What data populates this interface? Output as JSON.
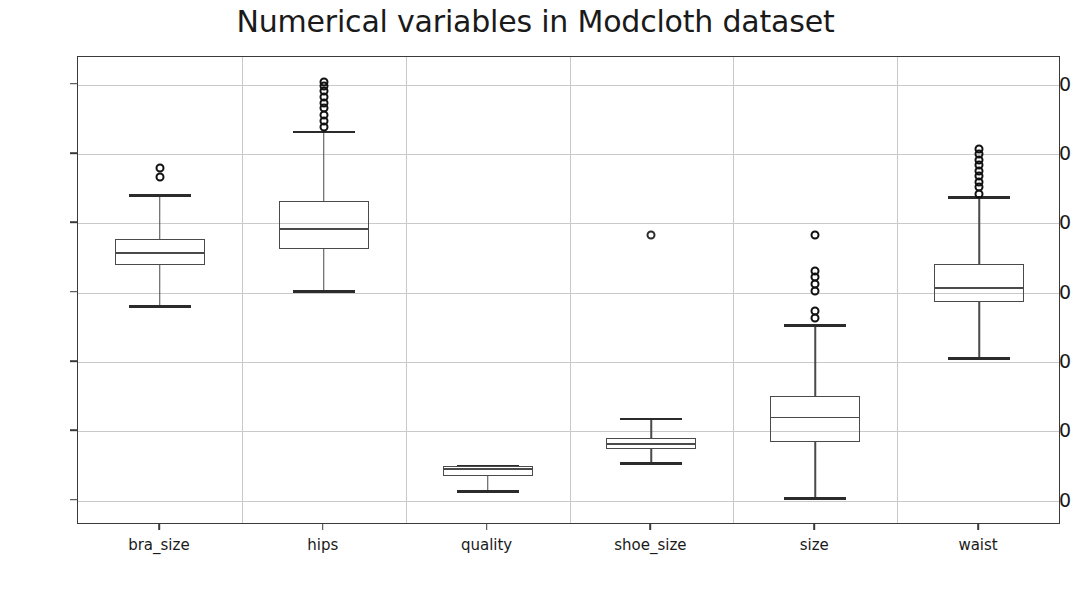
{
  "chart_data": {
    "type": "box",
    "title": "Numerical variables in Modcloth dataset",
    "xlabel": "",
    "ylabel": "",
    "ylim": [
      -3.5,
      64.0
    ],
    "yticks": [
      0,
      10,
      20,
      30,
      40,
      50,
      60
    ],
    "grid": true,
    "legend": null,
    "categories": [
      "bra_size",
      "hips",
      "quality",
      "shoe_size",
      "size",
      "waist"
    ],
    "boxes": [
      {
        "category": "bra_size",
        "whisker_low": 28.0,
        "q1": 34.0,
        "median": 35.7,
        "q3": 37.8,
        "whisker_high": 44.0,
        "outliers": [
          46.7,
          48.0
        ]
      },
      {
        "category": "hips",
        "whisker_low": 30.2,
        "q1": 36.3,
        "median": 39.2,
        "q3": 43.3,
        "whisker_high": 53.2,
        "outliers": [
          53.9,
          54.8,
          55.7,
          56.6,
          57.4,
          58.2,
          59.1,
          59.8,
          60.4
        ]
      },
      {
        "category": "quality",
        "whisker_low": 1.3,
        "q1": 3.5,
        "median": 4.6,
        "q3": 5.0,
        "whisker_high": 5.0,
        "outliers": []
      },
      {
        "category": "shoe_size",
        "whisker_low": 5.4,
        "q1": 7.5,
        "median": 8.2,
        "q3": 9.0,
        "whisker_high": 11.8,
        "outliers": [
          38.3
        ]
      },
      {
        "category": "size",
        "whisker_low": 0.3,
        "q1": 8.5,
        "median": 12.0,
        "q3": 15.1,
        "whisker_high": 25.3,
        "outliers": [
          26.3,
          27.3,
          30.2,
          31.2,
          32.2,
          33.1,
          38.3
        ]
      },
      {
        "category": "waist",
        "whisker_low": 20.5,
        "q1": 28.7,
        "median": 30.7,
        "q3": 34.2,
        "whisker_high": 43.7,
        "outliers": [
          44.3,
          45.2,
          46.0,
          46.8,
          47.6,
          48.4,
          49.2,
          50.0,
          50.7
        ]
      }
    ],
    "colors": {
      "box_edge": "#4a4a4a",
      "median": "#4a4a4a",
      "whisker": "#4a4a4a",
      "cap": "#2b2b2b",
      "flier": "#111111",
      "grid": "#c9c9c9",
      "axes": "#3a3a3a",
      "text": "#1a1a1a",
      "background": "#ffffff"
    }
  }
}
